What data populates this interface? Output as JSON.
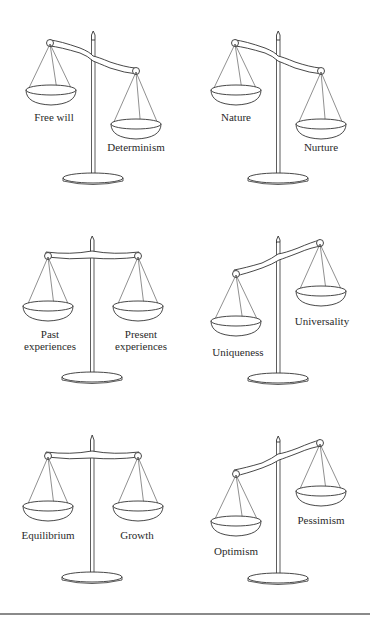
{
  "figure": {
    "type": "balance-scales-grid",
    "rows": 3,
    "cols": 2
  },
  "scales": [
    {
      "id": "free-will-determinism",
      "left_label": "Free will",
      "right_label": "Determinism",
      "tilt": "left-up"
    },
    {
      "id": "nature-nurture",
      "left_label": "Nature",
      "right_label": "Nurture",
      "tilt": "left-up"
    },
    {
      "id": "past-present",
      "left_label_line1": "Past",
      "left_label_line2": "experiences",
      "right_label_line1": "Present",
      "right_label_line2": "experiences",
      "tilt": "balanced"
    },
    {
      "id": "uniqueness-universality",
      "left_label": "Uniqueness",
      "right_label": "Universality",
      "tilt": "right-up"
    },
    {
      "id": "equilibrium-growth",
      "left_label": "Equilibrium",
      "right_label": "Growth",
      "tilt": "balanced"
    },
    {
      "id": "optimism-pessimism",
      "left_label": "Optimism",
      "right_label": "Pessimism",
      "tilt": "right-up"
    }
  ],
  "colors": {
    "ink": "#333333",
    "background": "#ffffff",
    "bottom_rule": "#8a8a8a"
  }
}
